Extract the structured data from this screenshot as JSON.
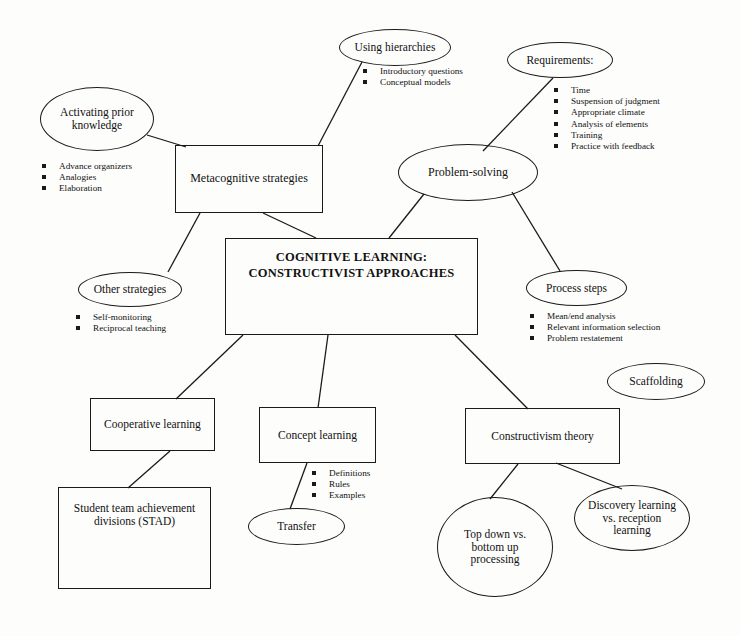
{
  "diagram": {
    "center": {
      "label": "COGNITIVE LEARNING:\nCONSTRUCTIVIST APPROACHES"
    },
    "nodes": [
      {
        "id": "activating-prior-knowledge",
        "shape": "ellipse",
        "label": "Activating prior\nknowledge",
        "x": 40,
        "y": 87,
        "w": 114,
        "h": 64,
        "font": 11.5
      },
      {
        "id": "metacognitive-strategies",
        "shape": "box",
        "label": "Metacognitive strategies",
        "x": 175,
        "y": 145,
        "w": 148,
        "h": 68,
        "font": 12
      },
      {
        "id": "using-hierarchies",
        "shape": "ellipse",
        "label": "Using hierarchies",
        "x": 339,
        "y": 29,
        "w": 112,
        "h": 37,
        "font": 11.5
      },
      {
        "id": "requirements",
        "shape": "ellipse",
        "label": "Requirements:",
        "x": 507,
        "y": 42,
        "w": 106,
        "h": 36,
        "font": 11.5
      },
      {
        "id": "problem-solving",
        "shape": "ellipse",
        "label": "Problem-solving",
        "x": 398,
        "y": 144,
        "w": 140,
        "h": 57,
        "font": 12
      },
      {
        "id": "other-strategies",
        "shape": "ellipse",
        "label": "Other strategies",
        "x": 78,
        "y": 272,
        "w": 104,
        "h": 35,
        "font": 11.5
      },
      {
        "id": "process-steps",
        "shape": "ellipse",
        "label": "Process steps",
        "x": 526,
        "y": 270,
        "w": 101,
        "h": 36,
        "font": 11.5
      },
      {
        "id": "scaffolding",
        "shape": "ellipse",
        "label": "Scaffolding",
        "x": 607,
        "y": 363,
        "w": 98,
        "h": 37,
        "font": 11.5
      },
      {
        "id": "cooperative-learning",
        "shape": "box",
        "label": "Cooperative learning",
        "x": 90,
        "y": 398,
        "w": 125,
        "h": 53,
        "font": 11.5
      },
      {
        "id": "concept-learning",
        "shape": "box",
        "label": "Concept learning",
        "x": 259,
        "y": 407,
        "w": 117,
        "h": 56,
        "font": 11.5
      },
      {
        "id": "constructivism-theory",
        "shape": "box",
        "label": "Constructivism theory",
        "x": 465,
        "y": 408,
        "w": 155,
        "h": 56,
        "font": 11.5
      },
      {
        "id": "student-team-achievement-divisions",
        "shape": "box",
        "label": "Student team achievement\ndivisions (STAD)",
        "x": 58,
        "y": 487,
        "w": 153,
        "h": 102,
        "font": 11.5,
        "align": "top",
        "pad": 14
      },
      {
        "id": "transfer",
        "shape": "ellipse",
        "label": "Transfer",
        "x": 248,
        "y": 508,
        "w": 97,
        "h": 37,
        "font": 11.5
      },
      {
        "id": "top-down-vs-bottom-up-processing",
        "shape": "ellipse",
        "label": "Top down vs.\nbottom up\nprocessing",
        "x": 437,
        "y": 497,
        "w": 116,
        "h": 100,
        "font": 11.5
      },
      {
        "id": "discovery-learning-vs-reception-learning",
        "shape": "ellipse",
        "label": "Discovery learning\nvs. reception\nlearning",
        "x": 574,
        "y": 485,
        "w": 116,
        "h": 66,
        "font": 11.5
      }
    ],
    "bullet_groups": [
      {
        "id": "activating-prior-knowledge-bullets",
        "x": 42,
        "y": 161,
        "items": [
          "Advance organizers",
          "Analogies",
          "Elaboration"
        ]
      },
      {
        "id": "using-hierarchies-bullets",
        "x": 363,
        "y": 66,
        "items": [
          "Introductory questions",
          "Conceptual models"
        ]
      },
      {
        "id": "requirements-bullets",
        "x": 554,
        "y": 85,
        "items": [
          "Time",
          "Suspension of judgment",
          "Appropriate climate",
          "Analysis of elements",
          "Training",
          "Practice with feedback"
        ]
      },
      {
        "id": "other-strategies-bullets",
        "x": 76,
        "y": 312,
        "items": [
          "Self-monitoring",
          "Reciprocal teaching"
        ]
      },
      {
        "id": "process-steps-bullets",
        "x": 530,
        "y": 311,
        "items": [
          "Mean/end analysis",
          "Relevant information selection",
          "Problem restatement"
        ]
      },
      {
        "id": "concept-learning-bullets",
        "x": 312,
        "y": 468,
        "items": [
          "Definitions",
          "Rules",
          "Examples"
        ]
      }
    ],
    "edges": [
      {
        "id": "edge-activating-to-metacognitive",
        "from": "activating-prior-knowledge",
        "to": "metacognitive-strategies",
        "x1": 147,
        "y1": 135,
        "x2": 186,
        "y2": 147
      },
      {
        "id": "edge-using-hierarchies-to-metacognitive",
        "from": "using-hierarchies",
        "to": "metacognitive-strategies",
        "x1": 362,
        "y1": 62,
        "x2": 318,
        "y2": 146
      },
      {
        "id": "edge-requirements-to-problem-solving",
        "from": "requirements",
        "to": "problem-solving",
        "x1": 553,
        "y1": 78,
        "x2": 483,
        "y2": 151
      },
      {
        "id": "edge-metacognitive-to-center",
        "from": "metacognitive-strategies",
        "to": "center",
        "x1": 263,
        "y1": 213,
        "x2": 316,
        "y2": 238
      },
      {
        "id": "edge-metacognitive-to-other-strategies",
        "from": "metacognitive-strategies",
        "to": "other-strategies",
        "x1": 200,
        "y1": 213,
        "x2": 168,
        "y2": 272
      },
      {
        "id": "edge-problem-solving-to-center",
        "from": "problem-solving",
        "to": "center",
        "x1": 424,
        "y1": 194,
        "x2": 389,
        "y2": 238
      },
      {
        "id": "edge-problem-solving-to-process-steps",
        "from": "problem-solving",
        "to": "process-steps",
        "x1": 512,
        "y1": 192,
        "x2": 560,
        "y2": 271
      },
      {
        "id": "edge-center-to-cooperative",
        "from": "center",
        "to": "cooperative-learning",
        "x1": 243,
        "y1": 335,
        "x2": 176,
        "y2": 399
      },
      {
        "id": "edge-center-to-concept-learning",
        "from": "center",
        "to": "concept-learning",
        "x1": 328,
        "y1": 335,
        "x2": 318,
        "y2": 408
      },
      {
        "id": "edge-center-to-constructivism",
        "from": "center",
        "to": "constructivism-theory",
        "x1": 455,
        "y1": 335,
        "x2": 528,
        "y2": 409
      },
      {
        "id": "edge-cooperative-to-stad",
        "from": "cooperative-learning",
        "to": "student-team-achievement-divisions",
        "x1": 170,
        "y1": 451,
        "x2": 128,
        "y2": 488
      },
      {
        "id": "edge-concept-learning-to-transfer",
        "from": "concept-learning",
        "to": "transfer",
        "x1": 307,
        "y1": 463,
        "x2": 290,
        "y2": 509
      },
      {
        "id": "edge-constructivism-to-topdown",
        "from": "constructivism-theory",
        "to": "top-down-vs-bottom-up-processing",
        "x1": 518,
        "y1": 464,
        "x2": 490,
        "y2": 499
      },
      {
        "id": "edge-constructivism-to-discovery",
        "from": "constructivism-theory",
        "to": "discovery-learning-vs-reception-learning",
        "x1": 556,
        "y1": 463,
        "x2": 622,
        "y2": 489
      }
    ],
    "colors": {
      "stroke": "#1a1a1a",
      "text": "#111111",
      "background": "#fdfdfc"
    }
  }
}
